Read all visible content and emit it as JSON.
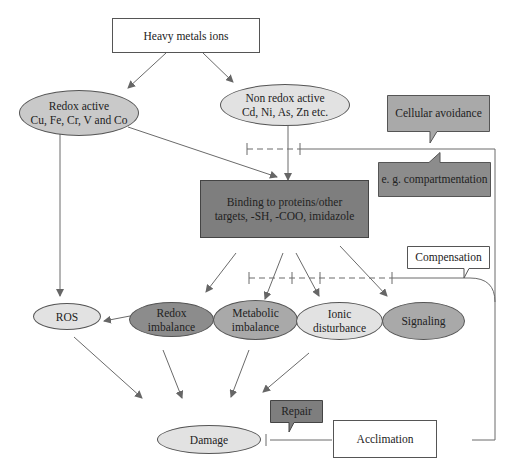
{
  "diagram": {
    "title_node": "Heavy metals ions",
    "redox_active": {
      "line1": "Redox active",
      "line2": "Cu, Fe, Cr, V and Co"
    },
    "non_redox_active": {
      "line1": "Non redox active",
      "line2": "Cd, Ni, As, Zn etc."
    },
    "binding": {
      "line1": "Binding to proteins/other",
      "line2": "targets, -SH, -COO, imidazole"
    },
    "ros": "ROS",
    "redox_imbalance": {
      "line1": "Redox",
      "line2": "imbalance"
    },
    "metabolic_imbalance": {
      "line1": "Metabolic",
      "line2": "imbalance"
    },
    "ionic_disturbance": {
      "line1": "Ionic",
      "line2": "disturbance"
    },
    "signaling": "Signaling",
    "damage": "Damage",
    "acclimation": "Acclimation",
    "callouts": {
      "cellular_avoidance": "Cellular avoidance",
      "compartmentation": "e. g. compartmentation",
      "compensation": "Compensation",
      "repair": "Repair"
    },
    "colors": {
      "light_fill": "#e2e2e2",
      "mid_fill": "#c9c9c9",
      "dark_fill": "#8c8c8c",
      "binding_fill": "#7e7e7e",
      "line": "#666666"
    }
  }
}
